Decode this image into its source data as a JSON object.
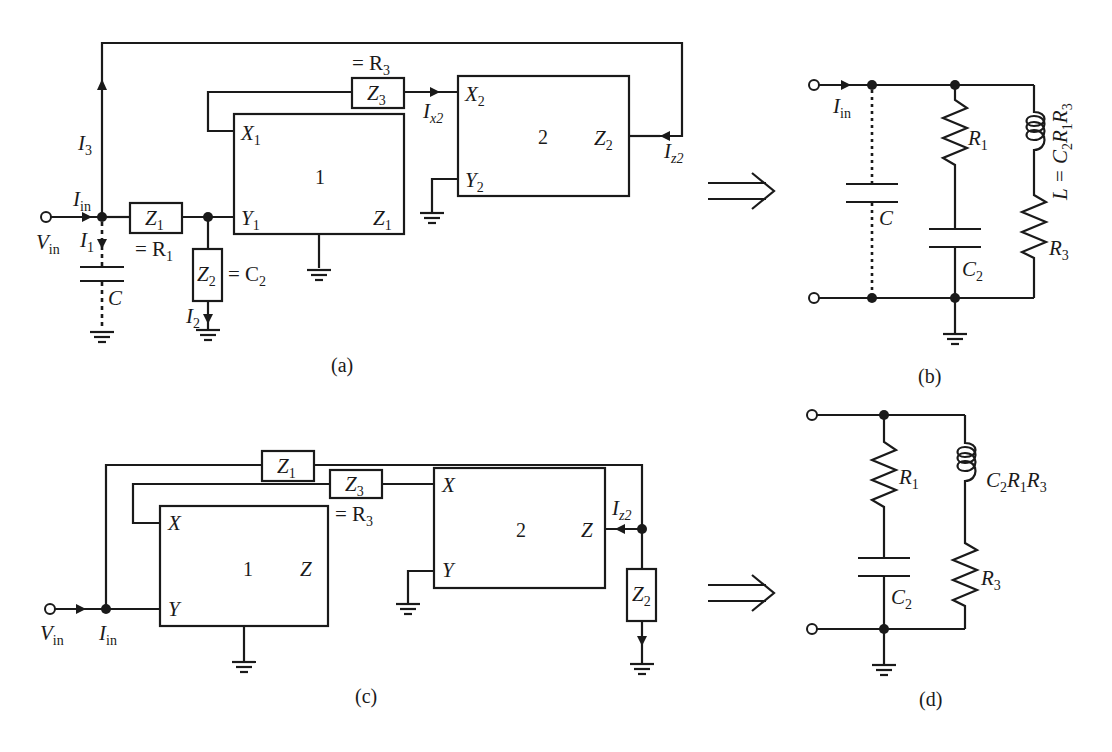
{
  "figure": {
    "panels": [
      {
        "id": "a",
        "caption": "(a)",
        "blocks": [
          {
            "number": "1",
            "ports": {
              "x": "X",
              "x_sub": "1",
              "y": "Y",
              "y_sub": "1",
              "z": "Z",
              "z_sub": "1"
            }
          },
          {
            "number": "2",
            "ports": {
              "x": "X",
              "x_sub": "2",
              "y": "Y",
              "y_sub": "2",
              "z": "Z",
              "z_sub": "2"
            }
          }
        ],
        "impedances": [
          {
            "name": "Z",
            "sub": "1",
            "equals": "= R",
            "equals_sub": "1"
          },
          {
            "name": "Z",
            "sub": "2",
            "equals": "= C",
            "equals_sub": "2"
          },
          {
            "name": "Z",
            "sub": "3",
            "equals": "= R",
            "equals_sub": "3"
          }
        ],
        "currents": [
          {
            "name": "I",
            "sub": "in"
          },
          {
            "name": "I",
            "sub": "1"
          },
          {
            "name": "I",
            "sub": "2"
          },
          {
            "name": "I",
            "sub": "3"
          },
          {
            "name": "I",
            "sub": "x2"
          },
          {
            "name": "I",
            "sub": "z2"
          }
        ],
        "input_voltage": {
          "name": "V",
          "sub": "in"
        },
        "parasitic_capacitor": "C"
      },
      {
        "id": "b",
        "caption": "(b)",
        "input_current": {
          "name": "I",
          "sub": "in"
        },
        "parasitic_capacitor": "C",
        "branch1": {
          "resistor": {
            "name": "R",
            "sub": "1"
          },
          "capacitor": {
            "name": "C",
            "sub": "2"
          }
        },
        "branch2": {
          "inductor_label": "L = C",
          "inductor_sub1": "2",
          "inductor_mid": "R",
          "inductor_sub2": "1",
          "inductor_end": "R",
          "inductor_sub3": "3",
          "resistor": {
            "name": "R",
            "sub": "3"
          }
        }
      },
      {
        "id": "c",
        "caption": "(c)",
        "blocks": [
          {
            "number": "1",
            "ports": {
              "x": "X",
              "y": "Y",
              "z": "Z"
            }
          },
          {
            "number": "2",
            "ports": {
              "x": "X",
              "y": "Y",
              "z": "Z"
            }
          }
        ],
        "impedances": [
          {
            "name": "Z",
            "sub": "1"
          },
          {
            "name": "Z",
            "sub": "2"
          },
          {
            "name": "Z",
            "sub": "3",
            "equals": "= R",
            "equals_sub": "3"
          }
        ],
        "currents": [
          {
            "name": "I",
            "sub": "in"
          },
          {
            "name": "I",
            "sub": "z2"
          }
        ],
        "input_voltage": {
          "name": "V",
          "sub": "in"
        }
      },
      {
        "id": "d",
        "caption": "(d)",
        "branch1": {
          "resistor": {
            "name": "R",
            "sub": "1"
          },
          "capacitor": {
            "name": "C",
            "sub": "2"
          }
        },
        "branch2": {
          "inductor_c": "C",
          "inductor_sub1": "2",
          "inductor_r1": "R",
          "inductor_sub2": "1",
          "inductor_r3": "R",
          "inductor_sub3": "3",
          "resistor": {
            "name": "R",
            "sub": "3"
          }
        }
      }
    ],
    "transform_arrow": "⟹"
  }
}
